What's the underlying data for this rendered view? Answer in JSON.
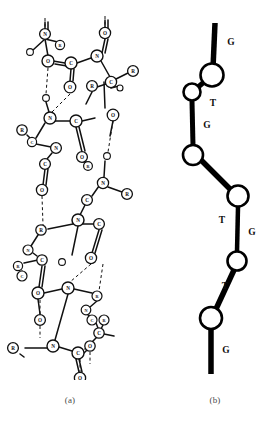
{
  "figure": {
    "type": "two-panel-scientific-figure",
    "background_color": "#ffffff",
    "ink_color": "#111111",
    "caption_color": "#4a4a4a"
  },
  "captions": {
    "panel_a": "(a)",
    "panel_b": "(b)"
  },
  "panel_a": {
    "name": "molecular-structure-diagram",
    "description": "Ball-and-stick antiparallel beta-sheet polypeptide backbone with hydrogen bonds",
    "atom_label_kinds": [
      "C",
      "N",
      "O",
      "R"
    ],
    "bond_style": {
      "covalent": "solid",
      "hydrogen": "dashed"
    },
    "atoms": [
      {
        "id": "a1",
        "label": "N",
        "x": 45,
        "y": 26,
        "r": 5.4
      },
      {
        "id": "a2",
        "label": "R",
        "x": 60,
        "y": 37,
        "r": 4.6
      },
      {
        "id": "a3",
        "label": "",
        "x": 30,
        "y": 44,
        "r": 3.4
      },
      {
        "id": "a4",
        "label": "O",
        "x": 48,
        "y": 53,
        "r": 6.0
      },
      {
        "id": "a5",
        "label": "C",
        "x": 71,
        "y": 55,
        "r": 6.0
      },
      {
        "id": "a6",
        "label": "N",
        "x": 97,
        "y": 48,
        "r": 6.0
      },
      {
        "id": "a7",
        "label": "O",
        "x": 105,
        "y": 25,
        "r": 5.6
      },
      {
        "id": "a8",
        "label": "O",
        "x": 70,
        "y": 79,
        "r": 5.8
      },
      {
        "id": "a9",
        "label": "R",
        "x": 133,
        "y": 63,
        "r": 5.4
      },
      {
        "id": "a10",
        "label": "C",
        "x": 111,
        "y": 74,
        "r": 5.6
      },
      {
        "id": "a11",
        "label": "",
        "x": 120,
        "y": 80,
        "r": 3.0
      },
      {
        "id": "a12",
        "label": "R",
        "x": 92,
        "y": 78,
        "r": 5.4
      },
      {
        "id": "a13",
        "label": "",
        "x": 46,
        "y": 90,
        "r": 3.4
      },
      {
        "id": "a14",
        "label": "N",
        "x": 50,
        "y": 110,
        "r": 6.0
      },
      {
        "id": "a15",
        "label": "C",
        "x": 76,
        "y": 113,
        "r": 6.0
      },
      {
        "id": "a16",
        "label": "O",
        "x": 113,
        "y": 107,
        "r": 5.8
      },
      {
        "id": "a17",
        "label": "R",
        "x": 22,
        "y": 122,
        "r": 5.2
      },
      {
        "id": "a18",
        "label": "C",
        "x": 32,
        "y": 134,
        "r": 4.6
      },
      {
        "id": "a19",
        "label": "N",
        "x": 56,
        "y": 140,
        "r": 5.4
      },
      {
        "id": "a20",
        "label": "C",
        "x": 45,
        "y": 156,
        "r": 5.4
      },
      {
        "id": "a21",
        "label": "O",
        "x": 82,
        "y": 149,
        "r": 5.4
      },
      {
        "id": "a22",
        "label": "R",
        "x": 88,
        "y": 158,
        "r": 4.4
      },
      {
        "id": "a23",
        "label": "O",
        "x": 42,
        "y": 182,
        "r": 5.6
      },
      {
        "id": "a24",
        "label": "",
        "x": 107,
        "y": 148,
        "r": 3.4
      },
      {
        "id": "a25",
        "label": "N",
        "x": 103,
        "y": 175,
        "r": 5.6
      },
      {
        "id": "a26",
        "label": "C",
        "x": 87,
        "y": 192,
        "r": 5.4
      },
      {
        "id": "a27",
        "label": "R",
        "x": 127,
        "y": 186,
        "r": 5.4
      },
      {
        "id": "a28",
        "label": "N",
        "x": 78,
        "y": 212,
        "r": 6.0
      },
      {
        "id": "a29",
        "label": "C",
        "x": 99,
        "y": 216,
        "r": 5.4
      },
      {
        "id": "a30",
        "label": "R",
        "x": 41,
        "y": 222,
        "r": 5.2
      },
      {
        "id": "a31",
        "label": "N",
        "x": 28,
        "y": 242,
        "r": 5.0
      },
      {
        "id": "a32",
        "label": "C",
        "x": 42,
        "y": 252,
        "r": 5.2
      },
      {
        "id": "a33",
        "label": "R",
        "x": 18,
        "y": 258,
        "r": 4.6
      },
      {
        "id": "a34",
        "label": "C",
        "x": 22,
        "y": 268,
        "r": 5.0
      },
      {
        "id": "a35",
        "label": "O",
        "x": 91,
        "y": 250,
        "r": 5.6
      },
      {
        "id": "a36",
        "label": "",
        "x": 62,
        "y": 254,
        "r": 3.4
      },
      {
        "id": "a37",
        "label": "O",
        "x": 38,
        "y": 285,
        "r": 6.0
      },
      {
        "id": "a38",
        "label": "N",
        "x": 68,
        "y": 280,
        "r": 6.0
      },
      {
        "id": "a39",
        "label": "R",
        "x": 97,
        "y": 288,
        "r": 5.0
      },
      {
        "id": "a40",
        "label": "N",
        "x": 86,
        "y": 302,
        "r": 4.8
      },
      {
        "id": "a41",
        "label": "C",
        "x": 92,
        "y": 312,
        "r": 5.0
      },
      {
        "id": "a42",
        "label": "R",
        "x": 104,
        "y": 312,
        "r": 5.0
      },
      {
        "id": "a43",
        "label": "C",
        "x": 99,
        "y": 325,
        "r": 5.2
      },
      {
        "id": "a44",
        "label": "O",
        "x": 40,
        "y": 312,
        "r": 5.4
      },
      {
        "id": "a45",
        "label": "N",
        "x": 53,
        "y": 338,
        "r": 6.0
      },
      {
        "id": "a46",
        "label": "C",
        "x": 78,
        "y": 345,
        "r": 6.0
      },
      {
        "id": "a47",
        "label": "O",
        "x": 90,
        "y": 338,
        "r": 5.2
      },
      {
        "id": "a48",
        "label": "R",
        "x": 13,
        "y": 340,
        "r": 5.4
      },
      {
        "id": "a49",
        "label": "O",
        "x": 80,
        "y": 370,
        "r": 5.6
      }
    ]
  },
  "panel_b": {
    "name": "backbone-zigzag-schematic",
    "description": "Simplified chain schematic, alternating conformational states along the backbone",
    "node_fill": "#ffffff",
    "node_stroke": "#000000",
    "bond_color": "#000000",
    "nodes": [
      {
        "id": "n1",
        "x": 44,
        "y": 67,
        "r": 11.5
      },
      {
        "id": "n2",
        "x": 24,
        "y": 84,
        "r": 8.5
      },
      {
        "id": "n3",
        "x": 25,
        "y": 147,
        "r": 10.0
      },
      {
        "id": "n4",
        "x": 70,
        "y": 188,
        "r": 10.5
      },
      {
        "id": "n5",
        "x": 69,
        "y": 253,
        "r": 9.5
      },
      {
        "id": "n6",
        "x": 43,
        "y": 310,
        "r": 11.0
      }
    ],
    "bonds": [
      {
        "from": "terminus-top",
        "to": "n1",
        "label": "G"
      },
      {
        "from": "n1",
        "to": "n2",
        "label": "T"
      },
      {
        "from": "n2",
        "to": "n3",
        "label": "G"
      },
      {
        "from": "n3",
        "to": "n4",
        "label": "T"
      },
      {
        "from": "n4",
        "to": "n5",
        "label": "G"
      },
      {
        "from": "n5",
        "to": "n6",
        "label": "T"
      },
      {
        "from": "n6",
        "to": "terminus-bottom",
        "label": "G"
      }
    ],
    "sequence": [
      "G",
      "T",
      "G",
      "T",
      "G",
      "T",
      "G"
    ],
    "labels": [
      {
        "text": "G",
        "x": 63,
        "y": 34
      },
      {
        "text": "T",
        "x": 45,
        "y": 95
      },
      {
        "text": "G",
        "x": 39,
        "y": 117
      },
      {
        "text": "T",
        "x": 54,
        "y": 212
      },
      {
        "text": "G",
        "x": 84,
        "y": 224
      },
      {
        "text": "T",
        "x": 57,
        "y": 278
      },
      {
        "text": "G",
        "x": 58,
        "y": 342
      }
    ]
  }
}
